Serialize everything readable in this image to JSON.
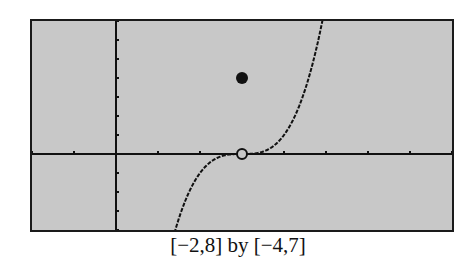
{
  "caption": "[−2,8] by [−4,7]",
  "colors": {
    "screen_bg": "#c8c8c8",
    "ink": "#111111"
  },
  "chart_data": {
    "type": "line",
    "title": "",
    "caption": "[−2,8] by [−4,7]",
    "xlim": [
      -2,
      8
    ],
    "ylim": [
      -4,
      7
    ],
    "xscl": 1,
    "yscl": 1,
    "grid": false,
    "axes": true,
    "function": "f(x) = (x-3)^3, x != 3; f(3) = 4",
    "series": [
      {
        "name": "curve",
        "x": [
          1.41,
          1.6,
          1.8,
          2.0,
          2.2,
          2.4,
          2.6,
          2.8,
          3.0,
          3.2,
          3.4,
          3.6,
          3.8,
          4.0,
          4.2,
          4.4,
          4.6,
          4.8,
          4.91
        ],
        "y": [
          -4.0,
          -2.74,
          -1.73,
          -1.0,
          -0.51,
          -0.22,
          -0.06,
          -0.01,
          0.0,
          0.01,
          0.06,
          0.22,
          0.51,
          1.0,
          1.73,
          2.74,
          4.1,
          5.83,
          7.0
        ]
      }
    ],
    "points": [
      {
        "name": "open-circle",
        "x": 3,
        "y": 0,
        "filled": false
      },
      {
        "name": "filled-dot",
        "x": 3,
        "y": 4,
        "filled": true
      }
    ]
  }
}
